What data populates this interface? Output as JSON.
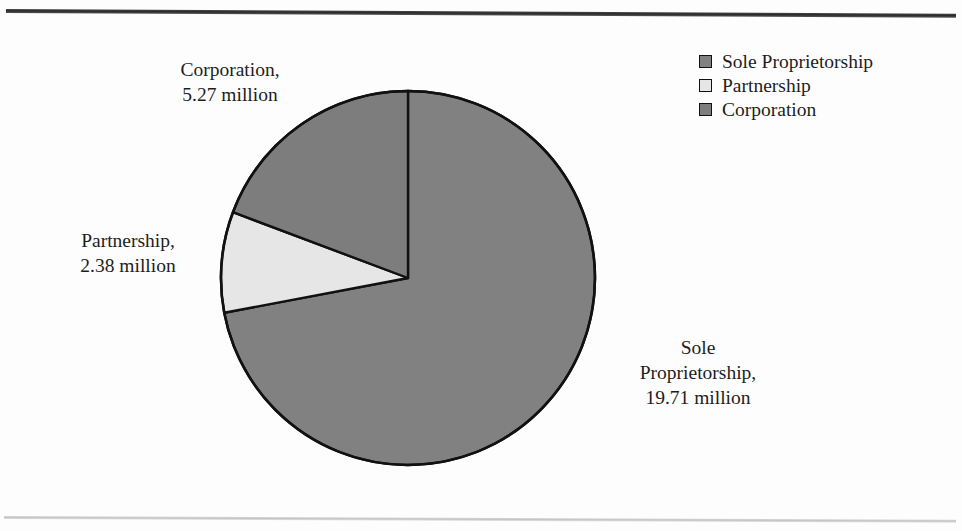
{
  "figure": {
    "background_color": "#fdfdfd",
    "title_fragment": "",
    "rules": {
      "top_color": "#2a2a2a",
      "bottom_color": "#c4c4c4"
    }
  },
  "legend": {
    "position": "top-right",
    "items": [
      {
        "label": "Sole Proprietorship",
        "color": "#818181"
      },
      {
        "label": "Partnership",
        "color": "#e6e6e6"
      },
      {
        "label": "Corporation",
        "color": "#7d7d7d"
      }
    ]
  },
  "callouts": {
    "corporation": "Corporation,\n5.27 million",
    "partnership": "Partnership,\n2.38 million",
    "sole_proprietorship": "Sole\nProprietorship,\n19.71 million"
  },
  "chart_data": {
    "type": "pie",
    "title": "",
    "xlabel": "",
    "ylabel": "",
    "unit": "million",
    "total": 27.36,
    "start_angle_deg": 0,
    "direction": "clockwise",
    "legend_position": "top-right",
    "grid": false,
    "categories": [
      "Sole Proprietorship",
      "Partnership",
      "Corporation"
    ],
    "values": [
      19.71,
      2.38,
      5.27
    ],
    "value_labels": [
      "19.71 million",
      "2.38 million",
      "5.27 million"
    ],
    "percentages": [
      72.04,
      8.7,
      19.26
    ],
    "angles_deg": [
      259.3,
      31.3,
      69.4
    ],
    "colors": [
      "#818181",
      "#e6e6e6",
      "#7d7d7d"
    ],
    "slice_border_color": "#111111",
    "geometry": {
      "cx": 190,
      "cy": 189,
      "r": 187
    }
  }
}
